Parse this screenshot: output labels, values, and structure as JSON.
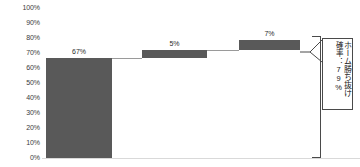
{
  "chart_data": {
    "type": "bar",
    "chart_style": "waterfall",
    "title": "",
    "xlabel": "",
    "ylabel": "",
    "ylim": [
      0,
      100
    ],
    "ytick_labels": [
      "100%",
      "90%",
      "80%",
      "70%",
      "60%",
      "50%",
      "40%",
      "30%",
      "20%",
      "10%",
      "0%"
    ],
    "ytick_values": [
      100,
      90,
      80,
      70,
      60,
      50,
      40,
      30,
      20,
      10,
      0
    ],
    "grid": false,
    "legend": "none",
    "categories": [
      "",
      "",
      ""
    ],
    "values": [
      67,
      5,
      7
    ],
    "data_labels": [
      "67%",
      "5%",
      "7%"
    ],
    "cumulative_start": [
      0,
      67,
      72
    ],
    "cumulative_end": [
      67,
      72,
      79
    ],
    "total": 79,
    "bar_color": "#595959",
    "connector_color": "#9a9a9a",
    "axis_text_color": "#3c3c3c"
  },
  "annotation": {
    "bracket_label_main": "ホーム勝ち抜け",
    "bracket_label_sub": "確率：79%",
    "bracket_from_value": 79,
    "bracket_to_value": 0,
    "border_color": "#4a4a4a"
  }
}
